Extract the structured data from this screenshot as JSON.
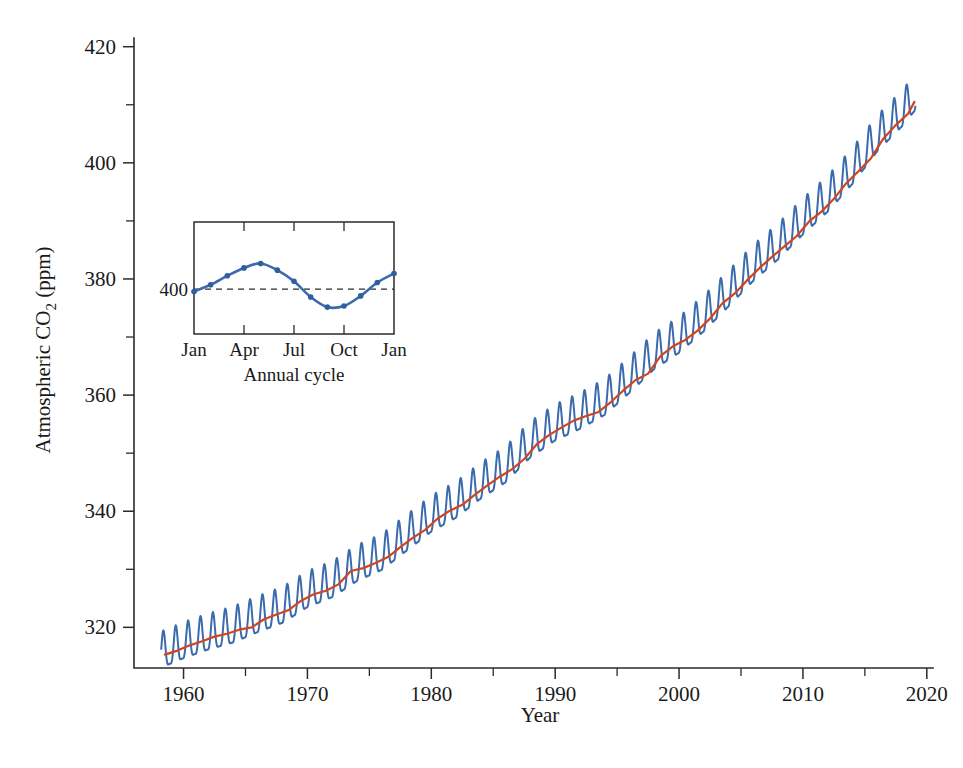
{
  "chart_data": {
    "type": "line",
    "title": "",
    "xlabel": "Year",
    "ylabel": "Atmospheric CO₂ (ppm)",
    "xlim": [
      1956.0,
      2020.5
    ],
    "ylim": [
      313.0,
      421.5
    ],
    "grid": false,
    "legend": "none",
    "x_ticks_major": [
      1960,
      1970,
      1980,
      1990,
      2000,
      2010,
      2020
    ],
    "x_ticklabels": [
      "1960",
      "1970",
      "1980",
      "1990",
      "2000",
      "2010",
      "2020"
    ],
    "x_ticks_minor": [
      1965,
      1975,
      1985,
      1995,
      2005,
      2015
    ],
    "y_ticks_major": [
      320,
      340,
      360,
      380,
      400,
      420
    ],
    "y_ticklabels": [
      "320",
      "340",
      "360",
      "380",
      "400",
      "420"
    ],
    "y_ticks_minor": [
      330,
      350,
      370,
      390,
      410
    ],
    "series": [
      {
        "name": "Monthly mean CO2 (seasonal)",
        "color": "#3A6BAE",
        "description": "Monthly atmospheric CO2 with annual sawtooth oscillation, Mauna Loa record",
        "x_start": 1958.2,
        "x_end": 2019.1,
        "samples_per_year": 24,
        "seasonal_amplitude_ppm": 3.1,
        "seasonal_peak_month": "May",
        "seasonal_trough_month": "September",
        "annual_anchors": [
          {
            "year": 1958.2,
            "value": 315.3
          },
          {
            "year": 1960.0,
            "value": 316.9
          },
          {
            "year": 1962.0,
            "value": 318.4
          },
          {
            "year": 1964.0,
            "value": 319.6
          },
          {
            "year": 1966.0,
            "value": 321.4
          },
          {
            "year": 1968.0,
            "value": 323.0
          },
          {
            "year": 1970.0,
            "value": 325.7
          },
          {
            "year": 1972.0,
            "value": 327.4
          },
          {
            "year": 1974.0,
            "value": 330.2
          },
          {
            "year": 1976.0,
            "value": 332.1
          },
          {
            "year": 1978.0,
            "value": 335.4
          },
          {
            "year": 1980.0,
            "value": 338.7
          },
          {
            "year": 1982.0,
            "value": 341.1
          },
          {
            "year": 1984.0,
            "value": 344.4
          },
          {
            "year": 1986.0,
            "value": 347.2
          },
          {
            "year": 1988.0,
            "value": 351.5
          },
          {
            "year": 1990.0,
            "value": 354.4
          },
          {
            "year": 1992.0,
            "value": 356.4
          },
          {
            "year": 1994.0,
            "value": 358.8
          },
          {
            "year": 1996.0,
            "value": 362.6
          },
          {
            "year": 1998.0,
            "value": 366.7
          },
          {
            "year": 2000.0,
            "value": 369.5
          },
          {
            "year": 2002.0,
            "value": 373.2
          },
          {
            "year": 2004.0,
            "value": 377.5
          },
          {
            "year": 2006.0,
            "value": 381.9
          },
          {
            "year": 2008.0,
            "value": 385.6
          },
          {
            "year": 2010.0,
            "value": 389.9
          },
          {
            "year": 2012.0,
            "value": 393.8
          },
          {
            "year": 2014.0,
            "value": 398.6
          },
          {
            "year": 2016.0,
            "value": 404.2
          },
          {
            "year": 2018.0,
            "value": 408.5
          },
          {
            "year": 2019.1,
            "value": 411.4
          }
        ]
      },
      {
        "name": "Annual mean trend",
        "color": "#D2441E",
        "description": "Deseasonalized annual mean trend line",
        "points": [
          {
            "x": 1958.5,
            "y": 315.3
          },
          {
            "x": 1959.5,
            "y": 316.0
          },
          {
            "x": 1960.5,
            "y": 316.9
          },
          {
            "x": 1961.5,
            "y": 317.6
          },
          {
            "x": 1962.5,
            "y": 318.4
          },
          {
            "x": 1963.5,
            "y": 318.9
          },
          {
            "x": 1964.5,
            "y": 319.6
          },
          {
            "x": 1965.5,
            "y": 320.0
          },
          {
            "x": 1966.5,
            "y": 321.4
          },
          {
            "x": 1967.5,
            "y": 322.2
          },
          {
            "x": 1968.5,
            "y": 323.0
          },
          {
            "x": 1969.5,
            "y": 324.6
          },
          {
            "x": 1970.5,
            "y": 325.7
          },
          {
            "x": 1971.5,
            "y": 326.3
          },
          {
            "x": 1972.5,
            "y": 327.4
          },
          {
            "x": 1973.5,
            "y": 329.7
          },
          {
            "x": 1974.5,
            "y": 330.2
          },
          {
            "x": 1975.5,
            "y": 331.1
          },
          {
            "x": 1976.5,
            "y": 332.1
          },
          {
            "x": 1977.5,
            "y": 333.8
          },
          {
            "x": 1978.5,
            "y": 335.4
          },
          {
            "x": 1979.5,
            "y": 336.8
          },
          {
            "x": 1980.5,
            "y": 338.7
          },
          {
            "x": 1981.5,
            "y": 340.1
          },
          {
            "x": 1982.5,
            "y": 341.1
          },
          {
            "x": 1983.5,
            "y": 342.8
          },
          {
            "x": 1984.5,
            "y": 344.4
          },
          {
            "x": 1985.5,
            "y": 345.9
          },
          {
            "x": 1986.5,
            "y": 347.2
          },
          {
            "x": 1987.5,
            "y": 349.0
          },
          {
            "x": 1988.5,
            "y": 351.5
          },
          {
            "x": 1989.5,
            "y": 353.1
          },
          {
            "x": 1990.5,
            "y": 354.4
          },
          {
            "x": 1991.5,
            "y": 355.6
          },
          {
            "x": 1992.5,
            "y": 356.4
          },
          {
            "x": 1993.5,
            "y": 357.1
          },
          {
            "x": 1994.5,
            "y": 358.8
          },
          {
            "x": 1995.5,
            "y": 360.8
          },
          {
            "x": 1996.5,
            "y": 362.6
          },
          {
            "x": 1997.5,
            "y": 363.7
          },
          {
            "x": 1998.5,
            "y": 366.7
          },
          {
            "x": 1999.5,
            "y": 368.4
          },
          {
            "x": 2000.5,
            "y": 369.5
          },
          {
            "x": 2001.5,
            "y": 371.1
          },
          {
            "x": 2002.5,
            "y": 373.2
          },
          {
            "x": 2003.5,
            "y": 375.8
          },
          {
            "x": 2004.5,
            "y": 377.5
          },
          {
            "x": 2005.5,
            "y": 379.8
          },
          {
            "x": 2006.5,
            "y": 381.9
          },
          {
            "x": 2007.5,
            "y": 383.8
          },
          {
            "x": 2008.5,
            "y": 385.6
          },
          {
            "x": 2009.5,
            "y": 387.4
          },
          {
            "x": 2010.5,
            "y": 389.9
          },
          {
            "x": 2011.5,
            "y": 391.6
          },
          {
            "x": 2012.5,
            "y": 393.8
          },
          {
            "x": 2013.5,
            "y": 396.5
          },
          {
            "x": 2014.5,
            "y": 398.6
          },
          {
            "x": 2015.5,
            "y": 400.8
          },
          {
            "x": 2016.5,
            "y": 404.2
          },
          {
            "x": 2017.5,
            "y": 406.5
          },
          {
            "x": 2018.5,
            "y": 408.5
          },
          {
            "x": 2019.0,
            "y": 410.5
          }
        ]
      }
    ]
  },
  "inset": {
    "xlabel": "Annual cycle",
    "x_ticklabels": [
      "Jan",
      "Apr",
      "Jul",
      "Oct",
      "Jan"
    ],
    "x_tick_positions": [
      0,
      3,
      6,
      9,
      12
    ],
    "y_ticklabel": "400",
    "y_reference_value": 400,
    "ylim": [
      396.0,
      406.0
    ],
    "line_color": "#3A6BAE",
    "marker_color": "#2F5F9E",
    "series_name": "Seasonal cycle (monthly detrended CO₂)",
    "points": [
      {
        "month": "Jan",
        "x": 0,
        "value": 399.8
      },
      {
        "month": "Feb",
        "x": 1,
        "value": 400.4
      },
      {
        "month": "Mar",
        "x": 2,
        "value": 401.2
      },
      {
        "month": "Apr",
        "x": 3,
        "value": 401.9
      },
      {
        "month": "May",
        "x": 4,
        "value": 402.3
      },
      {
        "month": "Jun",
        "x": 5,
        "value": 401.7
      },
      {
        "month": "Jul",
        "x": 6,
        "value": 400.7
      },
      {
        "month": "Aug",
        "x": 7,
        "value": 399.3
      },
      {
        "month": "Sep",
        "x": 8,
        "value": 398.4
      },
      {
        "month": "Oct",
        "x": 9,
        "value": 398.5
      },
      {
        "month": "Nov",
        "x": 10,
        "value": 399.4
      },
      {
        "month": "Dec",
        "x": 11,
        "value": 400.6
      },
      {
        "month": "Jan",
        "x": 12,
        "value": 401.4
      }
    ]
  },
  "colors": {
    "seasonal_blue": "#3A6BAE",
    "trend_red": "#D2441E",
    "axis_black": "#2b2b2b",
    "background": "#ffffff"
  }
}
